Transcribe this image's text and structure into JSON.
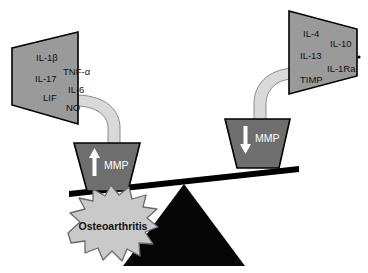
{
  "figure": {
    "colors": {
      "panel_fill": "#9a9a9a",
      "bucket_fill": "#6e6e6e",
      "tube_fill": "#d9d9d9",
      "tube_stroke": "#8a8a8a",
      "burst_fill": "#c9c9c9",
      "burst_stroke": "#6a6a6a",
      "fulcrum_fill": "#050505",
      "beam_fill": "#000000",
      "outline": "#000000",
      "label_text": "#111111",
      "bucket_text": "#ffffff",
      "background": "#ffffff"
    }
  },
  "left_panel": {
    "name": "pro-inflammatory-mediators",
    "labels": [
      {
        "text": "IL-1β",
        "x": 36,
        "y": 58
      },
      {
        "text": "TNF-α",
        "x": 63,
        "y": 72
      },
      {
        "text": "IL-17",
        "x": 35,
        "y": 79
      },
      {
        "text": "IL-6",
        "x": 68,
        "y": 90
      },
      {
        "text": "LIF",
        "x": 43,
        "y": 98
      },
      {
        "text": "NO",
        "x": 66,
        "y": 108
      }
    ]
  },
  "right_panel": {
    "name": "anti-inflammatory-mediators",
    "labels": [
      {
        "text": "IL-4",
        "x": 303,
        "y": 34
      },
      {
        "text": "IL-10",
        "x": 330,
        "y": 44
      },
      {
        "text": "IL-13",
        "x": 300,
        "y": 56
      },
      {
        "text": "IL-1Ra",
        "x": 327,
        "y": 69
      },
      {
        "text": "TIMP",
        "x": 300,
        "y": 80
      }
    ]
  },
  "left_bucket": {
    "name": "mmp-increase-bucket",
    "label": "MMP",
    "arrow_direction": "up"
  },
  "right_bucket": {
    "name": "mmp-decrease-bucket",
    "label": "MMP",
    "arrow_direction": "down"
  },
  "burst": {
    "name": "osteoarthritis-outcome",
    "label": "Osteoarthritis"
  }
}
